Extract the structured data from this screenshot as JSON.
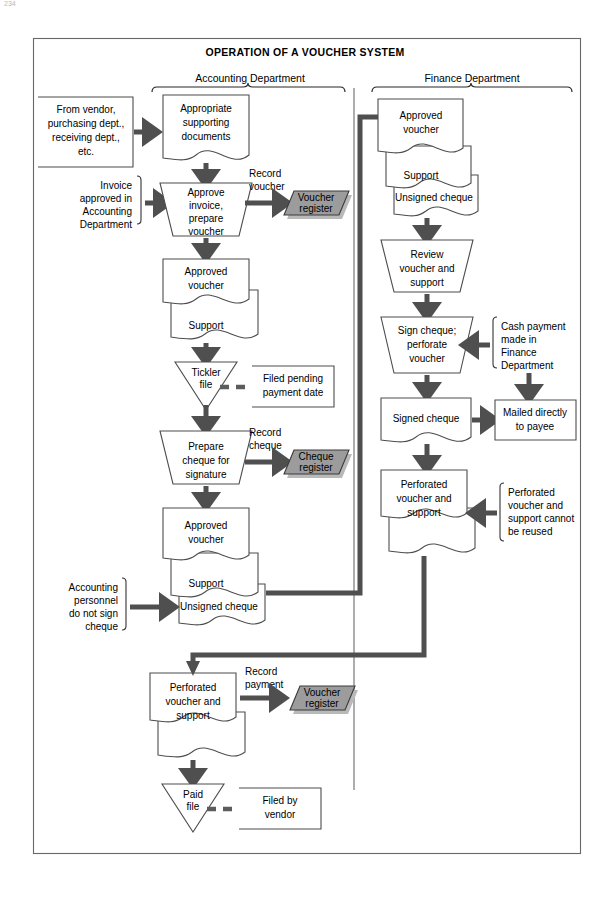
{
  "page": {
    "title": "OPERATION OF A VOUCHER SYSTEM",
    "corner_mark": "234"
  },
  "departments": [
    {
      "id": "accounting",
      "label": "Accounting Department"
    },
    {
      "id": "finance",
      "label": "Finance Department"
    }
  ],
  "colors": {
    "register_fill": "#9c9c9c",
    "register_shadow": "#b9b9b9",
    "shape_stroke": "#4d4d4d",
    "flow_line": "#4f4f4f",
    "frame": "#676767",
    "background": "#ffffff"
  },
  "nodes": {
    "source_vendor": {
      "shape": "open-box",
      "lines": [
        "From vendor,",
        "purchasing dept.,",
        "receiving dept.,",
        "etc."
      ]
    },
    "supporting_documents": {
      "shape": "document",
      "lines": [
        "Appropriate",
        "supporting",
        "documents"
      ]
    },
    "invoice_note": {
      "shape": "bracket-note",
      "lines": [
        "Invoice",
        "approved in",
        "Accounting",
        "Department"
      ]
    },
    "approve_invoice": {
      "shape": "inverted-trapezoid",
      "lines": [
        "Approve",
        "invoice,",
        "prepare",
        "voucher"
      ]
    },
    "record_voucher_label": {
      "shape": "label",
      "lines": [
        "Record",
        "voucher"
      ]
    },
    "voucher_register_1": {
      "shape": "parallelogram",
      "lines": [
        "Voucher",
        "register"
      ]
    },
    "approved_voucher_stack_1": {
      "shape": "document-stack",
      "lines": [
        "Approved",
        "voucher",
        "Support"
      ]
    },
    "tickler_file": {
      "shape": "triangle",
      "lines": [
        "Tickler",
        "file"
      ]
    },
    "filed_pending_note": {
      "shape": "open-box",
      "lines": [
        "Filed pending",
        "payment date"
      ]
    },
    "prepare_cheque": {
      "shape": "inverted-trapezoid",
      "lines": [
        "Prepare",
        "cheque for",
        "signature"
      ]
    },
    "record_cheque_label": {
      "shape": "label",
      "lines": [
        "Record",
        "cheque"
      ]
    },
    "cheque_register": {
      "shape": "parallelogram",
      "lines": [
        "Cheque",
        "register"
      ]
    },
    "approved_voucher_stack_2": {
      "shape": "document-stack",
      "lines": [
        "Approved",
        "voucher",
        "Support",
        "Unsigned cheque"
      ]
    },
    "accounting_personnel_note": {
      "shape": "bracket-note",
      "lines": [
        "Accounting",
        "personnel",
        "do not sign",
        "cheque"
      ]
    },
    "perforated_stack_accounting": {
      "shape": "document-stack",
      "lines": [
        "Perforated",
        "voucher and",
        "support"
      ]
    },
    "record_payment_label": {
      "shape": "label",
      "lines": [
        "Record",
        "payment"
      ]
    },
    "voucher_register_2": {
      "shape": "parallelogram",
      "lines": [
        "Voucher",
        "register"
      ]
    },
    "paid_file": {
      "shape": "triangle",
      "lines": [
        "Paid",
        "file"
      ]
    },
    "filed_by_vendor_note": {
      "shape": "open-box",
      "lines": [
        "Filed by",
        "vendor"
      ]
    },
    "approved_voucher_stack_finance": {
      "shape": "document-stack",
      "lines": [
        "Approved",
        "voucher",
        "Support",
        "Unsigned cheque"
      ]
    },
    "review_voucher": {
      "shape": "inverted-trapezoid",
      "lines": [
        "Review",
        "voucher and",
        "support"
      ]
    },
    "sign_cheque": {
      "shape": "inverted-trapezoid",
      "lines": [
        "Sign cheque;",
        "perforate",
        "voucher"
      ]
    },
    "cash_payment_note": {
      "shape": "bracket-note",
      "lines": [
        "Cash payment",
        "made in",
        "Finance",
        "Department"
      ]
    },
    "signed_cheque": {
      "shape": "document",
      "lines": [
        "Signed cheque"
      ]
    },
    "mailed_to_payee": {
      "shape": "open-box",
      "lines": [
        "Mailed directly",
        "to payee"
      ]
    },
    "perforated_stack_finance": {
      "shape": "document-stack",
      "lines": [
        "Perforated",
        "voucher and",
        "support"
      ]
    },
    "cannot_be_reused_note": {
      "shape": "bracket-note",
      "lines": [
        "Perforated",
        "voucher and",
        "support cannot",
        "be reused"
      ]
    }
  }
}
